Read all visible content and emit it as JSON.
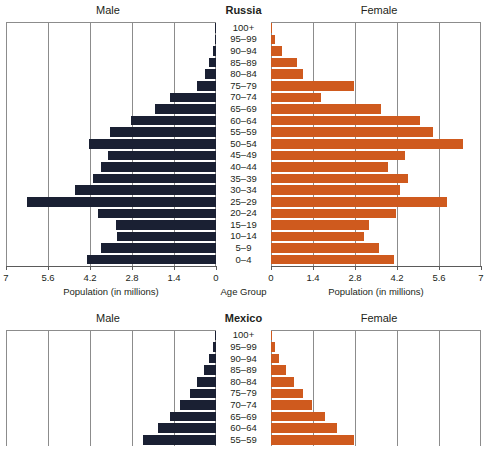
{
  "charts": [
    {
      "id": "russia",
      "title": "Russia",
      "male_label": "Male",
      "female_label": "Female",
      "center_axis_title": "Age Group",
      "left_axis_title": "Population (in millions)",
      "right_axis_title": "Population (in millions)",
      "left_ticks": [
        "7",
        "5.6",
        "4.2",
        "2.8",
        "1.4",
        "0"
      ],
      "right_ticks": [
        "0",
        "1.4",
        "2.8",
        "4.2",
        "5.6",
        "7"
      ],
      "truncated": false,
      "chart_data": {
        "type": "bar",
        "subtype": "population-pyramid",
        "title": "Russia",
        "xlabel": "Population (in millions)",
        "ylabel": "Age Group",
        "xlim": [
          0,
          7
        ],
        "tick_step": 1.4,
        "grid": true,
        "categories": [
          "100+",
          "95–99",
          "90–94",
          "85–89",
          "80–84",
          "75–79",
          "70–74",
          "65–69",
          "60–64",
          "55–59",
          "50–54",
          "45–49",
          "40–44",
          "35–39",
          "30–34",
          "25–29",
          "20–24",
          "15–19",
          "10–14",
          "5–9",
          "0–4"
        ],
        "series": [
          {
            "name": "Male",
            "color": "#1a2033",
            "values": [
              0.01,
              0.03,
              0.1,
              0.22,
              0.37,
              0.62,
              1.55,
              2.05,
              2.85,
              3.55,
              4.25,
              3.6,
              3.85,
              4.1,
              4.7,
              6.3,
              3.95,
              3.35,
              3.3,
              3.85,
              4.3
            ]
          },
          {
            "name": "Female",
            "color": "#cf5a1e",
            "values": [
              0.03,
              0.12,
              0.38,
              0.86,
              1.06,
              2.75,
              1.65,
              3.65,
              4.95,
              5.4,
              6.4,
              4.45,
              3.9,
              4.55,
              4.3,
              5.85,
              4.15,
              3.25,
              3.1,
              3.6,
              4.1
            ]
          }
        ]
      }
    },
    {
      "id": "mexico",
      "title": "Mexico",
      "male_label": "Male",
      "female_label": "Female",
      "center_axis_title": "Age Group",
      "left_axis_title": "Population (in millions)",
      "right_axis_title": "Population (in millions)",
      "left_ticks": [
        "7",
        "5.6",
        "4.2",
        "2.8",
        "1.4",
        "0"
      ],
      "right_ticks": [
        "0",
        "1.4",
        "2.8",
        "4.2",
        "5.6",
        "7"
      ],
      "truncated": true,
      "chart_data": {
        "type": "bar",
        "subtype": "population-pyramid",
        "title": "Mexico",
        "xlabel": "Population (in millions)",
        "ylabel": "Age Group",
        "xlim": [
          0,
          7
        ],
        "tick_step": 1.4,
        "grid": true,
        "note": "Chart cropped by screenshot edge; only rows 100+ through 55–59 visible",
        "categories": [
          "100+",
          "95–99",
          "90–94",
          "85–89",
          "80–84",
          "75–79",
          "70–74",
          "65–69",
          "60–64",
          "55–59"
        ],
        "series": [
          {
            "name": "Male",
            "color": "#1a2033",
            "values": [
              0.02,
              0.1,
              0.22,
              0.4,
              0.62,
              0.88,
              1.2,
              1.55,
              1.95,
              2.45
            ]
          },
          {
            "name": "Female",
            "color": "#cf5a1e",
            "values": [
              0.03,
              0.12,
              0.28,
              0.5,
              0.75,
              1.05,
              1.38,
              1.8,
              2.2,
              2.75
            ]
          }
        ]
      }
    }
  ]
}
